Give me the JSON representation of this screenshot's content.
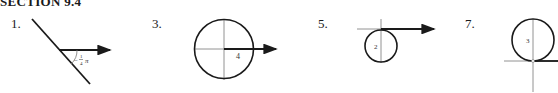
{
  "header": {
    "section_title": "SECTION 9.4"
  },
  "figures": [
    {
      "number": "1.",
      "angle_label_sign": "−",
      "angle_label_num": "1",
      "angle_label_den": "4",
      "angle_label_pi": "π"
    },
    {
      "number": "3.",
      "radius_label": "4"
    },
    {
      "number": "5.",
      "radius_label": "2"
    },
    {
      "number": "7.",
      "radius_label": "3"
    }
  ],
  "colors": {
    "line": "#1a1a1a",
    "axis": "#777777"
  }
}
